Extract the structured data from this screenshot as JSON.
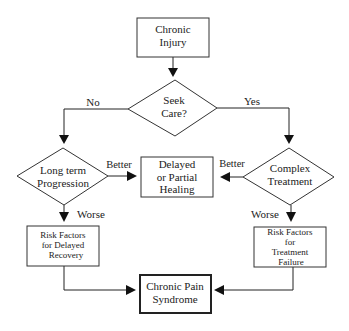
{
  "diagram": {
    "nodes": {
      "chronic_injury": {
        "type": "process",
        "lines": [
          "Chronic",
          "Injury"
        ]
      },
      "seek_care": {
        "type": "decision",
        "lines": [
          "Seek",
          "Care?"
        ]
      },
      "long_term_progression": {
        "type": "decision",
        "lines": [
          "Long term",
          "Progression"
        ]
      },
      "delayed_partial_healing": {
        "type": "process",
        "lines": [
          "Delayed",
          "or Partial",
          "Healing"
        ]
      },
      "complex_treatment": {
        "type": "decision",
        "lines": [
          "Complex",
          "Treatment"
        ]
      },
      "risk_delayed_recovery": {
        "type": "process",
        "lines": [
          "Risk Factors",
          "for Delayed",
          "Recovery"
        ]
      },
      "risk_treatment_failure": {
        "type": "process",
        "lines": [
          "Risk Factors",
          "for",
          "Treatment",
          "Failure"
        ]
      },
      "chronic_pain_syndrome": {
        "type": "terminal",
        "lines": [
          "Chronic Pain",
          "Syndrome"
        ]
      }
    },
    "edge_labels": {
      "no": "No",
      "yes": "Yes",
      "better_left": "Better",
      "better_right": "Better",
      "worse_left": "Worse",
      "worse_right": "Worse"
    },
    "edges": [
      {
        "from": "chronic_injury",
        "to": "seek_care",
        "label": ""
      },
      {
        "from": "seek_care",
        "to": "long_term_progression",
        "label": "No"
      },
      {
        "from": "seek_care",
        "to": "complex_treatment",
        "label": "Yes"
      },
      {
        "from": "long_term_progression",
        "to": "delayed_partial_healing",
        "label": "Better"
      },
      {
        "from": "complex_treatment",
        "to": "delayed_partial_healing",
        "label": "Better"
      },
      {
        "from": "long_term_progression",
        "to": "risk_delayed_recovery",
        "label": "Worse"
      },
      {
        "from": "complex_treatment",
        "to": "risk_treatment_failure",
        "label": "Worse"
      },
      {
        "from": "risk_delayed_recovery",
        "to": "chronic_pain_syndrome",
        "label": ""
      },
      {
        "from": "risk_treatment_failure",
        "to": "chronic_pain_syndrome",
        "label": ""
      }
    ]
  }
}
